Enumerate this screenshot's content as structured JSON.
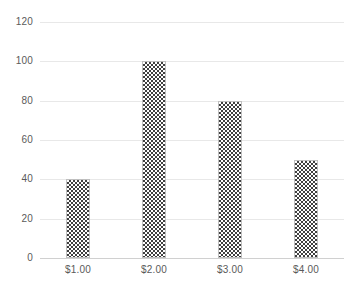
{
  "chart_data": {
    "type": "bar",
    "title": "",
    "subtitle": "",
    "xlabel": "",
    "ylabel": "",
    "categories": [
      "$1.00",
      "$2.00",
      "$3.00",
      "$4.00"
    ],
    "values": [
      40,
      100,
      80,
      50
    ],
    "series": [
      {
        "name": "",
        "values": [
          40,
          100,
          80,
          50
        ]
      }
    ],
    "ylim": [
      0,
      120
    ],
    "yticks": [
      0,
      20,
      40,
      60,
      80,
      100,
      120
    ],
    "ytick_labels": [
      "0",
      "20",
      "40",
      "60",
      "80",
      "100",
      "120"
    ],
    "grid": true,
    "grid_axis": "y",
    "legend": false,
    "legend_position": "none",
    "annotations": [],
    "colors": {
      "bar_pattern_dark": "#404040",
      "bar_pattern_light": "#ffffff",
      "bar_outline": "#bfbfbf",
      "gridline": "#e8e8e8",
      "baseline": "#d0d0d0",
      "tick_label": "#5a5a5a",
      "background": "#ffffff"
    }
  }
}
